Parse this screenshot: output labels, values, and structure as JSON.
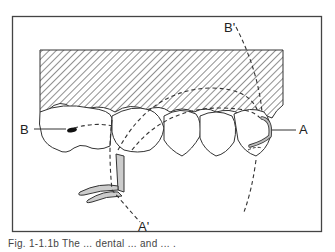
{
  "figure": {
    "type": "dental-illustration",
    "labels": {
      "A": "A",
      "A_prime": "A'",
      "B": "B",
      "B_prime": "B'"
    },
    "caption_partial": "Fig. 1-1.1b  The ... dental ... and ... ."
  }
}
